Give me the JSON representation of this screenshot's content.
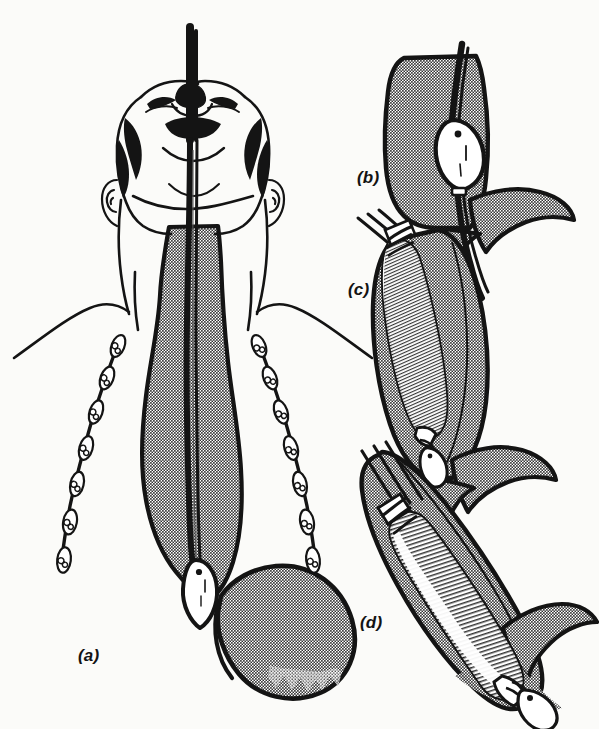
{
  "figure": {
    "background_color": "#fbfbf9",
    "ink_color": "#141414",
    "tissue_fill_color": "#c9c9c9",
    "lumen_fill_color": "#ffffff",
    "width": 599,
    "height": 729
  },
  "panels": [
    {
      "id": "a",
      "label": "(a)",
      "label_x": 78,
      "label_y": 646,
      "caption": "Patient supine with head extended; guidewire passed through mouth down dilated oesophagus into stomach",
      "contents": [
        "head-viewed-from-below",
        "neck-and-shoulders",
        "dilated-oesophagus",
        "stomach",
        "guidewire",
        "olive-dilator-at-cardia",
        "left-dilator-chain",
        "right-dilator-chain"
      ]
    },
    {
      "id": "b",
      "label": "(b)",
      "label_x": 357,
      "label_y": 168,
      "caption": "Olive dilator railroaded over guidewire, seated at the narrowed cardia",
      "contents": [
        "lower-oesophagus",
        "gastric-fundus",
        "guidewire",
        "olive-dilator"
      ]
    },
    {
      "id": "c",
      "label": "(c)",
      "label_x": 348,
      "label_y": 280,
      "caption": "Balloon dilator positioned across the stricture, partially inflated",
      "contents": [
        "lower-oesophagus",
        "balloon-dilator-partially-inflated",
        "catheter-shaft",
        "olive-tip"
      ]
    },
    {
      "id": "d",
      "label": "(d)",
      "label_x": 360,
      "label_y": 613,
      "caption": "Balloon fully inflated, dilating the stricture",
      "contents": [
        "lower-oesophagus",
        "balloon-dilator-fully-inflated",
        "catheter-shaft",
        "olive-tip"
      ]
    }
  ],
  "dilator_chains": {
    "left": {
      "olive_count": 7,
      "description": "Graduated olive dilators on flexible shaft"
    },
    "right": {
      "olive_count": 7,
      "description": "Graduated olive dilators on flexible shaft"
    }
  }
}
